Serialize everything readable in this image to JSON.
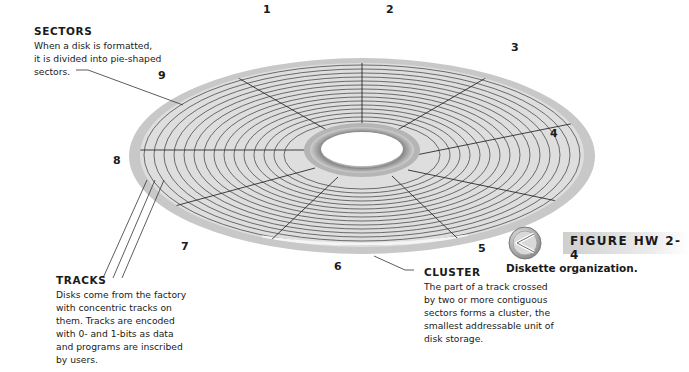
{
  "figure": {
    "label": "FIGURE HW 2-4",
    "caption": "Diskette organization.",
    "icon": "chevron-left-circle-icon",
    "accent_color": "#c0c0c0"
  },
  "callouts": {
    "sectors": {
      "title": "SECTORS",
      "body": [
        "When a disk is formatted,",
        "it is divided into pie-shaped",
        "sectors."
      ]
    },
    "tracks": {
      "title": "TRACKS",
      "body": [
        "Disks come from the factory",
        "with concentric tracks on",
        "them. Tracks are encoded",
        "with 0- and 1-bits as data",
        "and programs are inscribed",
        "by users."
      ]
    },
    "cluster": {
      "title": "CLUSTER",
      "body": [
        "The part of a track crossed",
        "by two or more contiguous",
        "sectors forms a cluster, the",
        "smallest addressable unit of",
        "disk storage."
      ]
    }
  },
  "sector_numbers": [
    "1",
    "2",
    "3",
    "4",
    "5",
    "6",
    "7",
    "8",
    "9"
  ],
  "colors": {
    "disk_rim": "#c9c9c9",
    "disk_surface": "#dcdcdc",
    "track_line": "#555555",
    "hub_ring": "#9a9a9a"
  }
}
